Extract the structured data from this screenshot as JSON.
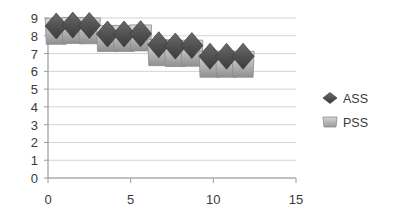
{
  "chart_data": {
    "type": "scatter",
    "title": "",
    "xlabel": "",
    "ylabel": "",
    "xlim": [
      0,
      15
    ],
    "ylim": [
      0,
      9
    ],
    "xticks": [
      0,
      5,
      10,
      15
    ],
    "yticks": [
      0,
      1,
      2,
      3,
      4,
      5,
      6,
      7,
      8,
      9
    ],
    "grid": true,
    "legend_position": "right",
    "series": [
      {
        "name": "ASS",
        "marker": "diamond",
        "color": "#595959",
        "x": [
          0.5,
          1.5,
          2.5,
          3.6,
          4.6,
          5.6,
          6.7,
          7.7,
          8.7,
          9.8,
          10.8,
          11.8
        ],
        "values": [
          8.55,
          8.6,
          8.58,
          8.1,
          8.1,
          8.12,
          7.5,
          7.42,
          7.45,
          6.85,
          6.85,
          6.85
        ]
      },
      {
        "name": "PSS",
        "marker": "square",
        "color": "#a6a6a6",
        "x": [
          0.5,
          1.5,
          2.5,
          3.6,
          4.6,
          5.6,
          6.7,
          7.7,
          8.7,
          9.8,
          10.8,
          11.8
        ],
        "values": [
          8.25,
          8.3,
          8.28,
          7.85,
          7.85,
          7.88,
          7.05,
          7.0,
          7.02,
          6.4,
          6.4,
          6.4
        ]
      }
    ]
  },
  "axes": {
    "y_labels": [
      "9",
      "8",
      "7",
      "6",
      "5",
      "4",
      "3",
      "2",
      "1",
      "0"
    ],
    "x_labels": [
      "0",
      "5",
      "10",
      "15"
    ]
  },
  "legend": {
    "items": [
      {
        "label": "ASS",
        "marker": "diamond-marker",
        "color": "#595959"
      },
      {
        "label": "PSS",
        "marker": "square-marker",
        "color": "#a6a6a6"
      }
    ]
  },
  "colors": {
    "grid": "#d2d2d2",
    "axis": "#9a9a9a",
    "ass_dark": "#4a4a4a",
    "ass_light": "#6e6e6e",
    "pss_dark": "#8a8a8a",
    "pss_light": "#c9c9c9",
    "text": "#3a3a3a",
    "background": "#ffffff"
  }
}
